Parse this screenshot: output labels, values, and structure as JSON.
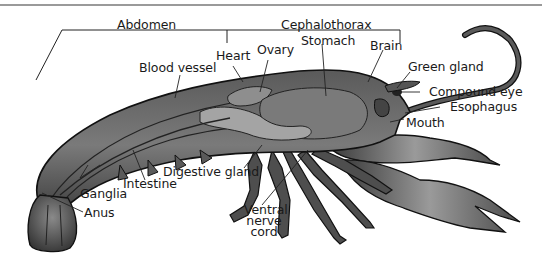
{
  "diagram": {
    "regions": [
      {
        "label": "Abdomen"
      },
      {
        "label": "Cephalothorax"
      }
    ],
    "labels": {
      "abdomen": "Abdomen",
      "cephalothorax": "Cephalothorax",
      "heart": "Heart",
      "ovary": "Ovary",
      "stomach": "Stomach",
      "brain": "Brain",
      "blood_vessel": "Blood vessel",
      "green_gland": "Green gland",
      "compound_eye": "Compound eye",
      "esophagus": "Esophagus",
      "mouth": "Mouth",
      "digestive_gland": "Digestive gland",
      "intestine": "Intestine",
      "ganglia": "Ganglia",
      "anus": "Anus",
      "ventral_nerve_cord_1": "Ventral",
      "ventral_nerve_cord_2": "nerve",
      "ventral_nerve_cord_3": "cord"
    },
    "colors": {
      "body_dark": "#3c3c3c",
      "body_mid": "#6e6e6e",
      "body_light": "#a8a8a8",
      "outline": "#111111",
      "leader_line": "#222222",
      "top_rule": "#9a9a9a"
    }
  }
}
